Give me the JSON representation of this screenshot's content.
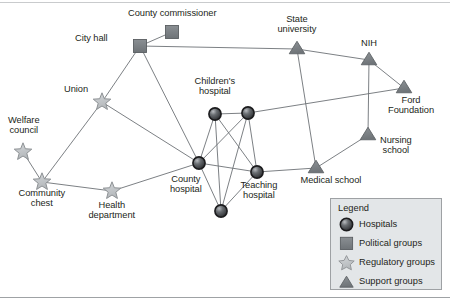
{
  "figure": {
    "type": "network-diagram",
    "title": ""
  },
  "palette": {
    "hospital_fill": "#4a4e52",
    "hospital_stroke": "#1b1b1d",
    "political_fill": "#7b8085",
    "political_stroke": "#5a5e62",
    "regulatory_fill": "#c2c5c8",
    "regulatory_stroke": "#8d9194",
    "support_fill": "#7e8387",
    "support_stroke": "#5f6367",
    "edge": "#6d7276",
    "legend_bg": "#e3e6e8",
    "legend_border": "#9ea1a4",
    "text": "#231f20"
  },
  "nodes": [
    {
      "id": "county_commissioner",
      "label": "County commissioner",
      "type": "political",
      "x": 172,
      "y": 32,
      "label_x": 172,
      "label_y": 8,
      "align": "ctr"
    },
    {
      "id": "city_hall",
      "label": "City hall",
      "type": "political",
      "x": 140,
      "y": 46,
      "label_x": 108,
      "label_y": 38,
      "align": "rt"
    },
    {
      "id": "state_university",
      "label": "State\nuniversity",
      "type": "support",
      "x": 297,
      "y": 49,
      "label_x": 297,
      "label_y": 14,
      "align": "ctr"
    },
    {
      "id": "nih",
      "label": "NIH",
      "type": "support",
      "x": 369,
      "y": 60,
      "label_x": 369,
      "label_y": 38,
      "align": "ctr"
    },
    {
      "id": "ford_foundation",
      "label": "Ford\nFoundation",
      "type": "support",
      "x": 404,
      "y": 88,
      "label_x": 411,
      "label_y": 95,
      "align": "ctr"
    },
    {
      "id": "union",
      "label": "Union",
      "type": "regulatory",
      "x": 102,
      "y": 102,
      "label_x": 88,
      "label_y": 89,
      "align": "rt"
    },
    {
      "id": "childrens_hospital",
      "label": "Children's\nhospital",
      "type": "hospital",
      "x": 215,
      "y": 114,
      "label_x": 215,
      "label_y": 76,
      "align": "ctr"
    },
    {
      "id": "hospital_b",
      "label": "",
      "type": "hospital",
      "x": 248,
      "y": 113,
      "label_x": 0,
      "label_y": 0,
      "align": "ctr"
    },
    {
      "id": "nursing_school",
      "label": "Nursing\nschool",
      "type": "support",
      "x": 368,
      "y": 135,
      "label_x": 396,
      "label_y": 135,
      "align": "ctr"
    },
    {
      "id": "welfare_council",
      "label": "Welfare\ncouncil",
      "type": "regulatory",
      "x": 23,
      "y": 152,
      "label_x": 24,
      "label_y": 115,
      "align": "ctr"
    },
    {
      "id": "county_hospital",
      "label": "County\nhospital",
      "type": "hospital",
      "x": 199,
      "y": 163,
      "label_x": 186,
      "label_y": 174,
      "align": "ctr"
    },
    {
      "id": "medical_school",
      "label": "Medical school",
      "type": "support",
      "x": 316,
      "y": 168,
      "label_x": 331,
      "label_y": 175,
      "align": "ctr"
    },
    {
      "id": "teaching_hospital",
      "label": "Teaching\nhospital",
      "type": "hospital",
      "x": 257,
      "y": 172,
      "label_x": 259,
      "label_y": 180,
      "align": "ctr"
    },
    {
      "id": "community_chest",
      "label": "Community\nchest",
      "type": "regulatory",
      "x": 42,
      "y": 182,
      "label_x": 42,
      "label_y": 188,
      "align": "ctr"
    },
    {
      "id": "health_department",
      "label": "Health\ndepartment",
      "type": "regulatory",
      "x": 112,
      "y": 191,
      "label_x": 112,
      "label_y": 200,
      "align": "ctr"
    },
    {
      "id": "hospital_e",
      "label": "",
      "type": "hospital",
      "x": 221,
      "y": 211,
      "label_x": 0,
      "label_y": 0,
      "align": "ctr"
    }
  ],
  "edges": [
    {
      "from": "city_hall",
      "to": "county_commissioner"
    },
    {
      "from": "city_hall",
      "to": "state_university"
    },
    {
      "from": "city_hall",
      "to": "union"
    },
    {
      "from": "city_hall",
      "to": "county_hospital"
    },
    {
      "from": "state_university",
      "to": "nih"
    },
    {
      "from": "state_university",
      "to": "medical_school"
    },
    {
      "from": "nih",
      "to": "ford_foundation"
    },
    {
      "from": "nih",
      "to": "nursing_school"
    },
    {
      "from": "ford_foundation",
      "to": "hospital_b"
    },
    {
      "from": "nursing_school",
      "to": "medical_school"
    },
    {
      "from": "medical_school",
      "to": "teaching_hospital"
    },
    {
      "from": "union",
      "to": "county_hospital"
    },
    {
      "from": "union",
      "to": "community_chest"
    },
    {
      "from": "welfare_council",
      "to": "community_chest"
    },
    {
      "from": "community_chest",
      "to": "health_department"
    },
    {
      "from": "health_department",
      "to": "county_hospital"
    },
    {
      "from": "childrens_hospital",
      "to": "hospital_b"
    },
    {
      "from": "childrens_hospital",
      "to": "county_hospital"
    },
    {
      "from": "childrens_hospital",
      "to": "teaching_hospital"
    },
    {
      "from": "childrens_hospital",
      "to": "hospital_e"
    },
    {
      "from": "hospital_b",
      "to": "county_hospital"
    },
    {
      "from": "hospital_b",
      "to": "teaching_hospital"
    },
    {
      "from": "hospital_b",
      "to": "hospital_e"
    },
    {
      "from": "county_hospital",
      "to": "teaching_hospital"
    },
    {
      "from": "county_hospital",
      "to": "hospital_e"
    },
    {
      "from": "teaching_hospital",
      "to": "hospital_e"
    }
  ],
  "legend": {
    "title": "Legend",
    "items": [
      {
        "symbol": "hospital-circle-icon",
        "label": "Hospitals"
      },
      {
        "symbol": "political-square-icon",
        "label": "Political groups"
      },
      {
        "symbol": "regulatory-star-icon",
        "label": "Regulatory groups"
      },
      {
        "symbol": "support-triangle-icon",
        "label": "Support groups"
      }
    ]
  }
}
